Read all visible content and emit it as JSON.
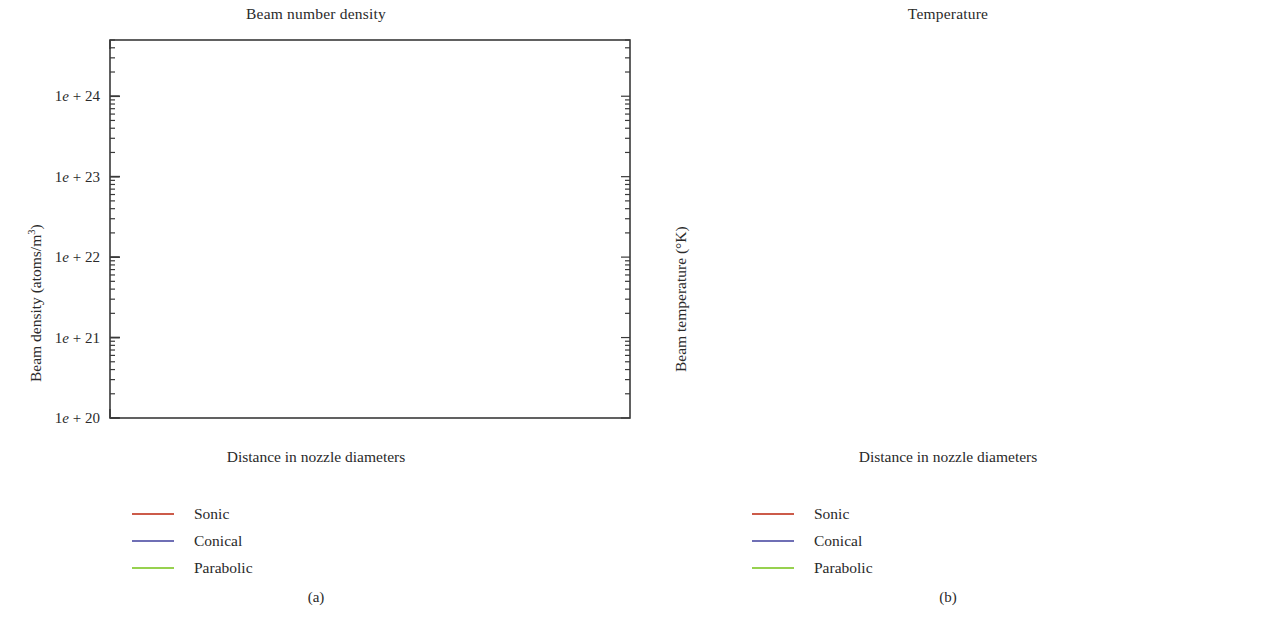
{
  "figure": {
    "caption_a": "(a)",
    "caption_b": "(b)"
  },
  "panel_a": {
    "title": "Beam number density",
    "ylabel_text": "Beam density (atoms/m3)",
    "xlabel": "Distance in nozzle diameters",
    "ytick_labels": [
      "1e + 20",
      "1e + 21",
      "1e + 22",
      "1e + 23",
      "1e + 24"
    ],
    "xtick_labels": [
      "0",
      "10",
      "20",
      "30",
      "40",
      "50"
    ],
    "legend": [
      {
        "label": "Sonic",
        "color": "#cc5b4a"
      },
      {
        "label": "Conical",
        "color": "#6f6fb5"
      },
      {
        "label": "Parabolic",
        "color": "#97d14f"
      }
    ]
  },
  "panel_b": {
    "title": "Temperature",
    "ylabel_text": "Beam temperature (°K)",
    "xlabel": "Distance in nozzle diameters",
    "ytick_labels": [
      "10",
      "100"
    ],
    "xtick_labels": [
      "0",
      "10",
      "20",
      "30",
      "40",
      "50"
    ],
    "legend": [
      {
        "label": "Sonic",
        "color": "#cc5b4a"
      },
      {
        "label": "Conical",
        "color": "#6f6fb5"
      },
      {
        "label": "Parabolic",
        "color": "#97d14f"
      }
    ]
  },
  "chart_data": [
    {
      "type": "line",
      "id": "beam-number-density",
      "title": "Beam number density",
      "xlabel": "Distance in nozzle diameters",
      "ylabel": "Beam density (atoms/m3)",
      "yscale": "log",
      "xlim": [
        0,
        50
      ],
      "ylim": [
        1e+20,
        5e+24
      ],
      "ytick_values": [
        1e+20,
        1e+21,
        1e+22,
        1e+23,
        1e+24
      ],
      "ytick_labels": [
        "1e + 20",
        "1e + 21",
        "1e + 22",
        "1e + 23",
        "1e + 24"
      ],
      "xtick_values": [
        0,
        10,
        20,
        30,
        40,
        50
      ],
      "grid": false,
      "legend_position": "below-left",
      "x": [
        0,
        0.5,
        1,
        1.5,
        2,
        3,
        4,
        5,
        6,
        8,
        10,
        12.5,
        15,
        17.5,
        20,
        22.5,
        25,
        27.5,
        30,
        32.5,
        35,
        37.5,
        40,
        42.5,
        45,
        47.5,
        50
      ],
      "series": [
        {
          "name": "Sonic",
          "color": "#cc5b4a",
          "values": [
            4e+24,
            2.2e+24,
            9e+23,
            4.6e+23,
            2.8e+23,
            1.45e+23,
            9e+22,
            6.2e+22,
            4.6e+22,
            2.9e+22,
            2.05e+22,
            1.45e+22,
            1.05e+22,
            8e+21,
            6.3e+21,
            5e+21,
            4e+21,
            3.3e+21,
            2.7e+21,
            2.25e+21,
            1.9e+21,
            1.6e+21,
            1.35e+21,
            1.1e+21,
            8.5e+20,
            6.2e+20,
            4.6e+20
          ]
        },
        {
          "name": "Conical",
          "color": "#6f6fb5",
          "values": [
            3.6e+24,
            3e+24,
            1.6e+24,
            9e+23,
            6.5e+23,
            4.4e+23,
            3.4e+23,
            2.8e+23,
            2.4e+23,
            1.75e+23,
            1.32e+23,
            9.4e+22,
            7e+22,
            5.4e+22,
            4.3e+22,
            3.5e+22,
            2.9e+22,
            2.45e+22,
            2.08e+22,
            1.78e+22,
            1.54e+22,
            1.34e+22,
            1.17e+22,
            1.02e+22,
            8.9e+21,
            7.8e+21,
            6.9e+21
          ]
        },
        {
          "name": "Parabolic",
          "color": "#97d14f",
          "values": [
            4.4e+24,
            4e+24,
            2.6e+24,
            1.75e+24,
            1.3e+24,
            8.2e+23,
            5.8e+23,
            4.4e+23,
            3.5e+23,
            2.3e+23,
            1.62e+23,
            1.07e+23,
            7.5e+22,
            5.5e+22,
            4.2e+22,
            3.3e+22,
            2.65e+22,
            2.15e+22,
            1.78e+22,
            1.49e+22,
            1.26e+22,
            1.08e+22,
            9.2e+21,
            7.8e+21,
            6.6e+21,
            5.5e+21,
            4.6e+21
          ]
        }
      ]
    },
    {
      "type": "line",
      "id": "beam-temperature",
      "title": "Temperature",
      "xlabel": "Distance in nozzle diameters",
      "ylabel": "Beam temperature (°K)",
      "yscale": "log",
      "xlim": [
        0,
        50
      ],
      "ylim": [
        3.0,
        330
      ],
      "ytick_values": [
        10,
        100
      ],
      "ytick_labels": [
        "10",
        "100"
      ],
      "xtick_values": [
        0,
        10,
        20,
        30,
        40,
        50
      ],
      "grid": false,
      "legend_position": "below-left",
      "x": [
        0,
        0.5,
        1,
        1.5,
        2,
        3,
        4,
        5,
        6,
        8,
        10,
        12.5,
        15,
        17.5,
        20,
        22.5,
        25,
        27.5,
        30,
        32.5,
        35,
        37.5,
        40,
        42.5,
        45,
        47.5,
        50
      ],
      "series": [
        {
          "name": "Sonic",
          "color": "#cc5b4a",
          "values": [
            290,
            215,
            140,
            95,
            70,
            45,
            32,
            24.5,
            19.5,
            13.8,
            10.6,
            8.3,
            6.8,
            5.8,
            5.0,
            4.5,
            4.1,
            3.85,
            3.65,
            3.55,
            3.5,
            3.45,
            3.4,
            3.3,
            3.2,
            3.15,
            3.1
          ]
        },
        {
          "name": "Conical",
          "color": "#6f6fb5",
          "values": [
            295,
            255,
            175,
            110,
            78,
            57,
            48,
            42,
            37.5,
            31,
            26,
            21.5,
            18.5,
            16.2,
            14.3,
            12.8,
            11.5,
            10.5,
            9.6,
            8.8,
            8.1,
            7.5,
            7.0,
            6.4,
            5.9,
            5.4,
            5.1
          ]
        },
        {
          "name": "Parabolic",
          "color": "#97d14f",
          "values": [
            300,
            285,
            220,
            165,
            130,
            95,
            74,
            60,
            51,
            38,
            30,
            23,
            18.2,
            15.0,
            12.6,
            10.9,
            9.5,
            8.4,
            7.5,
            6.8,
            6.2,
            5.6,
            5.0,
            4.3,
            3.9,
            3.7,
            3.6
          ]
        }
      ]
    }
  ]
}
